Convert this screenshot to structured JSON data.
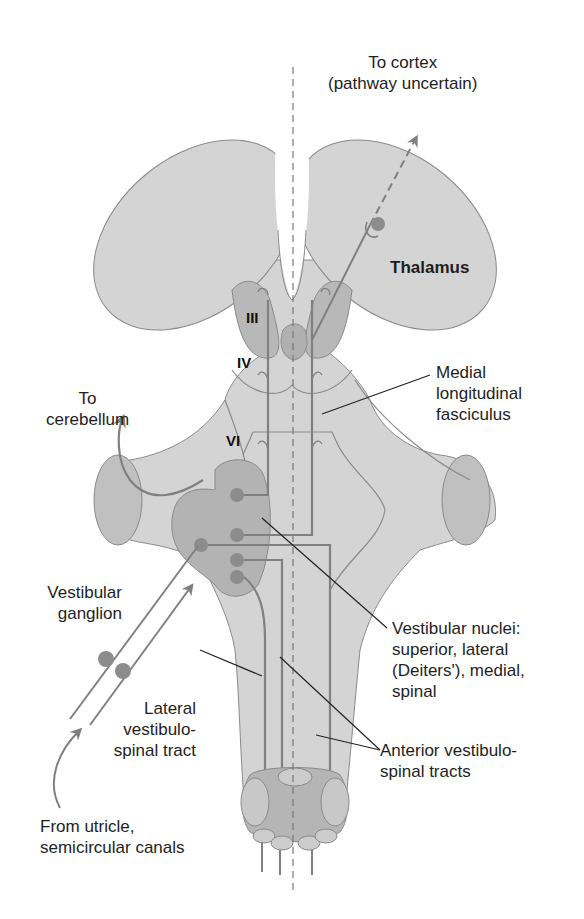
{
  "figure": {
    "colors": {
      "background": "#ffffff",
      "tissue_fill": "#d4d4d4",
      "tissue_stroke": "#8a8a8a",
      "nucleus_fill": "#b3b3b3",
      "nucleus_dot": "#8c8c8c",
      "fiber": "#808080",
      "leader_line": "#222222",
      "midline_dash": "#777777"
    }
  },
  "labels": {
    "to_cortex": [
      "To cortex",
      "(pathway uncertain)"
    ],
    "thalamus": "Thalamus",
    "to_cerebellum": [
      "To",
      "cerebellum"
    ],
    "mlf": [
      "Medial",
      "longitudinal",
      "fasciculus"
    ],
    "vestibular_ganglion": [
      "Vestibular",
      "ganglion"
    ],
    "vestibular_nuclei": [
      "Vestibular nuclei:",
      "superior, lateral",
      "(Deiters'), medial,",
      "spinal"
    ],
    "lateral_vst": [
      "Lateral",
      "vestibulo-",
      "spinal tract"
    ],
    "anterior_vst": [
      "Anterior vestibulo-",
      "spinal tracts"
    ],
    "from_utricle": [
      "From utricle,",
      "semicircular canals"
    ]
  },
  "cranial_nuclei": {
    "III": "III",
    "IV": "IV",
    "VI": "VI"
  }
}
